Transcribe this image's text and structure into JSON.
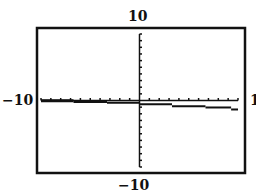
{
  "chart_data": {
    "type": "line",
    "title": "",
    "xlabel": "",
    "ylabel": "",
    "window": {
      "xmin": -10,
      "xmax": 10,
      "ymin": -10,
      "ymax": 10,
      "xmin_label": "−10",
      "xmax_label": "1",
      "ymin_label": "−10",
      "ymax_label": "10"
    },
    "grid": false,
    "legend": null,
    "series": [
      {
        "name": "step function",
        "segments": [
          {
            "x_start": -10,
            "x_end": -6.7,
            "y": 0.1
          },
          {
            "x_start": -6.7,
            "x_end": -3.3,
            "y": 0.0
          },
          {
            "x_start": -3.3,
            "x_end": 0,
            "y": -0.2
          },
          {
            "x_start": 0,
            "x_end": 3.3,
            "y": -0.4
          },
          {
            "x_start": 3.3,
            "x_end": 6.7,
            "y": -0.7
          },
          {
            "x_start": 6.7,
            "x_end": 9.3,
            "y": -0.9
          },
          {
            "x_start": 9.3,
            "x_end": 10,
            "y": -1.2
          }
        ]
      }
    ]
  }
}
